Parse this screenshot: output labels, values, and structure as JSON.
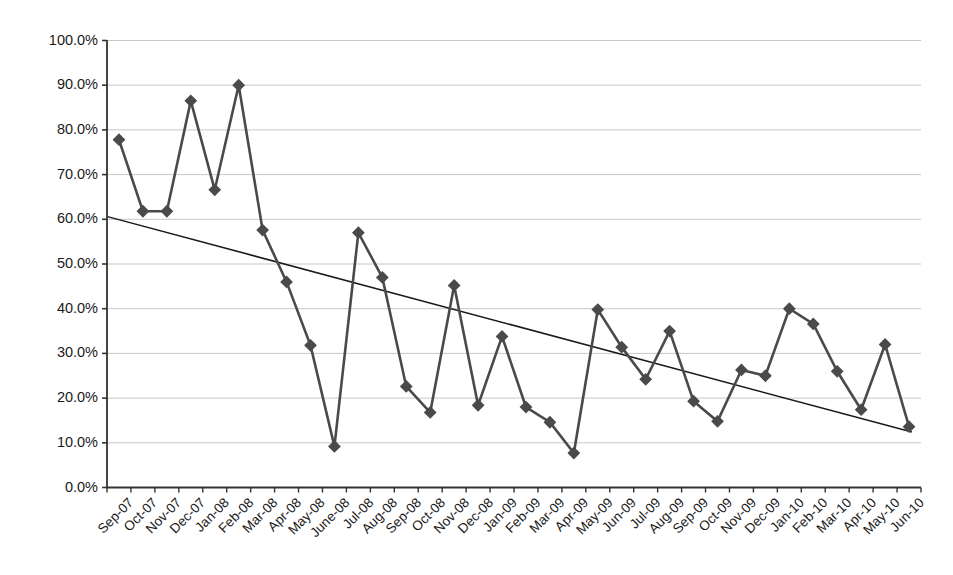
{
  "chart_data": {
    "type": "line",
    "title": "",
    "subtitle": "",
    "xlabel": "",
    "ylabel": "",
    "ylim": [
      0,
      1.0
    ],
    "ytick_labels": [
      "0.0%",
      "10.0%",
      "20.0%",
      "30.0%",
      "40.0%",
      "50.0%",
      "60.0%",
      "70.0%",
      "80.0%",
      "90.0%",
      "100.0%"
    ],
    "ytick_values": [
      0,
      10,
      20,
      30,
      40,
      50,
      60,
      70,
      80,
      90,
      100
    ],
    "grid": "horizontal",
    "legend": "none",
    "marker": "diamond",
    "series_color": "#4a4a4a",
    "trendline_color": "#1a1a1a",
    "gridline_color": "#c8c8c8",
    "axis_color": "#333333",
    "categories": [
      "Sep-07",
      "Oct-07",
      "Nov-07",
      "Dec-07",
      "Jan-08",
      "Feb-08",
      "Mar-08",
      "Apr-08",
      "May-08",
      "June-08",
      "Jul-08",
      "Aug-08",
      "Sep-08",
      "Oct-08",
      "Nov-08",
      "Dec-08",
      "Jan-09",
      "Feb-09",
      "Mar-09",
      "Apr-09",
      "May-09",
      "Jun-09",
      "Jul-09",
      "Aug-09",
      "Sep-09",
      "Oct-09",
      "Nov-09",
      "Dec-09",
      "Jan-10",
      "Feb-10",
      "Mar-10",
      "Apr-10",
      "May-10",
      "Jun-10"
    ],
    "series": [
      {
        "name": "Percentage",
        "values": [
          77.8,
          61.8,
          61.8,
          86.5,
          66.6,
          90.0,
          57.6,
          46.0,
          31.8,
          9.2,
          57.0,
          47.0,
          22.6,
          16.8,
          45.2,
          18.4,
          33.8,
          18.0,
          14.6,
          7.7,
          39.8,
          31.4,
          24.2,
          35.0,
          19.3,
          14.8,
          26.3,
          25.0,
          40.0,
          36.6,
          26.0,
          17.4,
          32.0,
          13.6
        ]
      }
    ],
    "trendline": {
      "name": "Linear trend",
      "start_value": 60.6,
      "end_value": 12.4
    }
  }
}
